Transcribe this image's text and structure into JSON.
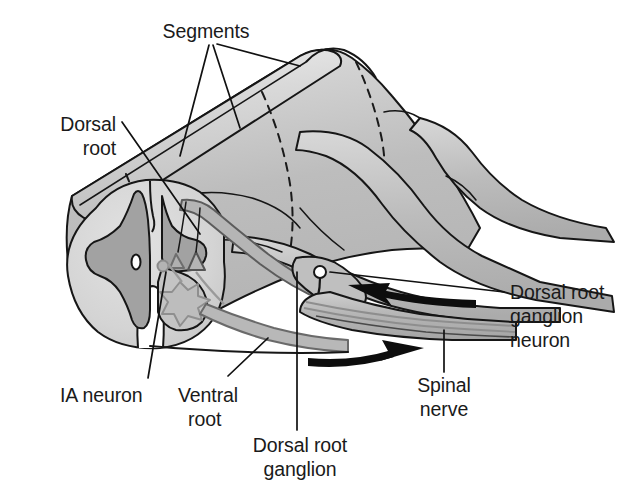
{
  "figure": {
    "type": "anatomical-diagram"
  },
  "labels": {
    "segments": "Segments",
    "dorsal_root_line1": "Dorsal",
    "dorsal_root_line2": "root",
    "ia_neuron": "IA neuron",
    "ventral_root_line1": "Ventral",
    "ventral_root_line2": "root",
    "dorsal_root_ganglion_line1": "Dorsal root",
    "dorsal_root_ganglion_line2": "ganglion",
    "drg_neuron_line1": "Dorsal root",
    "drg_neuron_line2": "ganglion",
    "drg_neuron_line3": "neuron",
    "spinal_nerve_line1": "Spinal",
    "spinal_nerve_line2": "nerve"
  },
  "colors": {
    "white_matter": "#d6d6d6",
    "gray_matter": "#a6a6a6",
    "cord_body": "#c2c2c2",
    "nerve_band": "#bcbcbc",
    "root_band": "#b0b0b0",
    "outline": "#161616",
    "text": "#1a1a1a",
    "background": "#ffffff"
  },
  "structures": [
    "spinal-cord-cross-section",
    "dorsal-gray-horn",
    "ventral-gray-horn",
    "central-canal",
    "ia-neuron-soma",
    "motor-neuron-soma",
    "dorsal-root",
    "ventral-root",
    "dorsal-root-ganglion",
    "dorsal-root-ganglion-neuron-soma",
    "spinal-nerve",
    "cord-body-3d",
    "segment-boundaries"
  ],
  "arrows": [
    {
      "name": "afferent-arrow",
      "direction": "left",
      "meaning": "sensory input toward cord"
    },
    {
      "name": "efferent-arrow",
      "direction": "right",
      "meaning": "motor output away from cord"
    }
  ]
}
